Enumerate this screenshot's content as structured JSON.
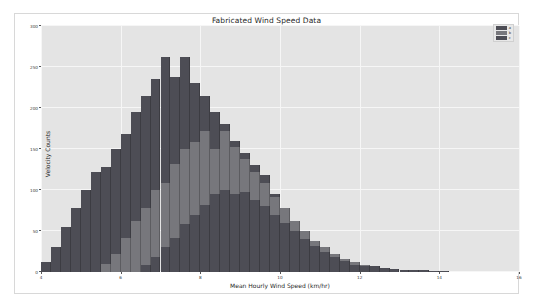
{
  "chart": {
    "title": "Fabricated Wind Speed Data",
    "xlabel": "Mean Hourly Wind Speed (km/hr)",
    "ylabel": "Velocity Counts"
  },
  "legend": {
    "items": [
      {
        "label": "a",
        "color": "#4d4d55"
      },
      {
        "label": "b",
        "color": "#77777c"
      },
      {
        "label": "c",
        "color": "#4d4d55"
      }
    ]
  },
  "chart_data": {
    "type": "bar",
    "title": "Fabricated Wind Speed Data",
    "xlabel": "Mean Hourly Wind Speed (km/hr)",
    "ylabel": "Velocity Counts",
    "xlim": [
      4,
      16
    ],
    "ylim": [
      0,
      300
    ],
    "xticks": [
      4,
      6,
      8,
      10,
      12,
      14,
      16
    ],
    "yticks": [
      0,
      50,
      100,
      150,
      200,
      250,
      300
    ],
    "grid": true,
    "legend_position": "upper right",
    "bin_width": 0.25,
    "overlap": "layered",
    "series": [
      {
        "name": "a",
        "color": "#4d4d55",
        "bin_starts": [
          4.0,
          4.25,
          4.5,
          4.75,
          5.0,
          5.25,
          5.5,
          5.75,
          6.0,
          6.25,
          6.5,
          6.75,
          7.0,
          7.25,
          7.5,
          7.75,
          8.0,
          8.25,
          8.5,
          8.75,
          9.0,
          9.25,
          9.5,
          9.75,
          10.0,
          10.25,
          10.5,
          10.75,
          11.0,
          11.25,
          11.5,
          11.75,
          12.0,
          12.25,
          12.5,
          12.75,
          13.0,
          13.25,
          13.5,
          13.75,
          14.0
        ],
        "values": [
          12,
          30,
          55,
          78,
          100,
          122,
          128,
          150,
          168,
          195,
          215,
          235,
          262,
          238,
          262,
          230,
          215,
          195,
          180,
          160,
          145,
          130,
          118,
          95,
          78,
          62,
          48,
          38,
          28,
          22,
          16,
          12,
          9,
          7,
          5,
          4,
          3,
          2,
          2,
          1,
          1
        ]
      },
      {
        "name": "b",
        "color": "#77777c",
        "bin_starts": [
          5.5,
          5.75,
          6.0,
          6.25,
          6.5,
          6.75,
          7.0,
          7.25,
          7.5,
          7.75,
          8.0,
          8.25,
          8.5,
          8.75,
          9.0,
          9.25,
          9.5,
          9.75,
          10.0,
          10.25,
          10.5,
          10.75,
          11.0,
          11.25,
          11.5,
          11.75,
          12.0,
          12.25,
          12.5
        ],
        "values": [
          10,
          22,
          42,
          62,
          78,
          100,
          108,
          132,
          150,
          158,
          172,
          150,
          172,
          152,
          138,
          122,
          108,
          92,
          78,
          62,
          50,
          38,
          30,
          22,
          16,
          12,
          8,
          5,
          3
        ]
      },
      {
        "name": "c",
        "color": "#4d4d55",
        "bin_starts": [
          6.5,
          6.75,
          7.0,
          7.25,
          7.5,
          7.75,
          8.0,
          8.25,
          8.5,
          8.75,
          9.0,
          9.25,
          9.5,
          9.75,
          10.0,
          10.25,
          10.5,
          10.75,
          11.0,
          11.25,
          11.5,
          11.75,
          12.0,
          12.25,
          12.5,
          12.75,
          13.0
        ],
        "values": [
          8,
          18,
          30,
          42,
          58,
          70,
          82,
          95,
          100,
          95,
          98,
          88,
          80,
          70,
          60,
          50,
          40,
          32,
          24,
          18,
          13,
          9,
          7,
          5,
          3,
          2,
          1
        ]
      }
    ]
  }
}
